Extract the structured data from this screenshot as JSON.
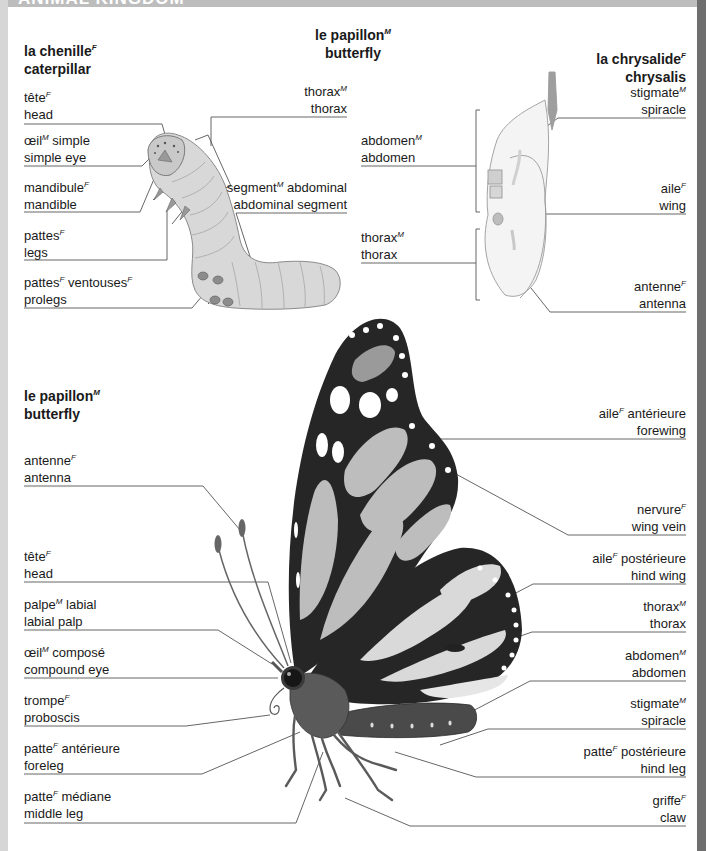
{
  "header": {
    "section_title": "ANIMAL KINGDOM"
  },
  "caterpillar": {
    "title": {
      "fr": "la chenille",
      "gender": "F",
      "en": "caterpillar"
    },
    "labels": [
      {
        "fr": "tête",
        "gender": "F",
        "en": "head"
      },
      {
        "fr": "œil",
        "gender": "M",
        "fr_suffix": " simple",
        "en": "simple eye"
      },
      {
        "fr": "mandibule",
        "gender": "F",
        "en": "mandible"
      },
      {
        "fr": "pattes",
        "gender": "F",
        "en": "legs"
      },
      {
        "fr": "pattes",
        "gender": "F",
        "fr_suffix": " ventouses",
        "gender2": "F",
        "en": "prolegs"
      },
      {
        "fr": "thorax",
        "gender": "M",
        "en": "thorax"
      },
      {
        "fr": "segment",
        "gender": "M",
        "fr_suffix": " abdominal",
        "en": "abdominal segment"
      }
    ]
  },
  "center_title": {
    "fr": "le papillon",
    "gender": "M",
    "en": "butterfly"
  },
  "chrysalis": {
    "title": {
      "fr": "la chrysalide",
      "gender": "F",
      "en": "chrysalis"
    },
    "labels": [
      {
        "fr": "stigmate",
        "gender": "M",
        "en": "spiracle"
      },
      {
        "fr": "abdomen",
        "gender": "M",
        "en": "abdomen"
      },
      {
        "fr": "aile",
        "gender": "F",
        "en": "wing"
      },
      {
        "fr": "thorax",
        "gender": "M",
        "en": "thorax"
      },
      {
        "fr": "antenne",
        "gender": "F",
        "en": "antenna"
      }
    ]
  },
  "butterfly": {
    "title": {
      "fr": "le papillon",
      "gender": "M",
      "en": "butterfly"
    },
    "left_labels": [
      {
        "fr": "antenne",
        "gender": "F",
        "en": "antenna"
      },
      {
        "fr": "tête",
        "gender": "F",
        "en": "head"
      },
      {
        "fr": "palpe",
        "gender": "M",
        "fr_suffix": " labial",
        "en": "labial palp"
      },
      {
        "fr": "œil",
        "gender": "M",
        "fr_suffix": " composé",
        "en": "compound eye"
      },
      {
        "fr": "trompe",
        "gender": "F",
        "en": "proboscis"
      },
      {
        "fr": "patte",
        "gender": "F",
        "fr_suffix": " antérieure",
        "en": "foreleg"
      },
      {
        "fr": "patte",
        "gender": "F",
        "fr_suffix": " médiane",
        "en": "middle leg"
      }
    ],
    "right_labels": [
      {
        "fr": "aile",
        "gender": "F",
        "fr_suffix": " antérieure",
        "en": "forewing"
      },
      {
        "fr": "nervure",
        "gender": "F",
        "en": "wing vein"
      },
      {
        "fr": "aile",
        "gender": "F",
        "fr_suffix": " postérieure",
        "en": "hind wing"
      },
      {
        "fr": "thorax",
        "gender": "M",
        "en": "thorax"
      },
      {
        "fr": "abdomen",
        "gender": "M",
        "en": "abdomen"
      },
      {
        "fr": "stigmate",
        "gender": "M",
        "en": "spiracle"
      },
      {
        "fr": "patte",
        "gender": "F",
        "fr_suffix": " postérieure",
        "en": "hind leg"
      },
      {
        "fr": "griffe",
        "gender": "F",
        "en": "claw"
      }
    ]
  },
  "colors": {
    "leader_line": "#555555",
    "wing_dark": "#262626",
    "wing_light": "#bcbcbc",
    "wing_mid": "#8c8c8c",
    "caterpillar_body": "#d4d4d4",
    "right_border": "#6e6e6e"
  }
}
